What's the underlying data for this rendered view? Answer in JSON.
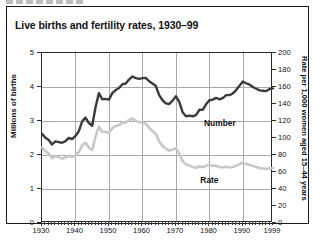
{
  "title": "Live births and fertility rates, 1930–99",
  "axis": {
    "left_title": "Millions of births",
    "right_title": "Rate per 1,000 women aged 15–44 years",
    "left_ticks": [
      "0",
      "1",
      "2",
      "3",
      "4",
      "5"
    ],
    "right_ticks": [
      "0",
      "20",
      "40",
      "60",
      "80",
      "100",
      "120",
      "140",
      "160",
      "180",
      "200"
    ],
    "x_ticks": [
      "1930",
      "1940",
      "1950",
      "1960",
      "1970",
      "1980",
      "1990",
      "1999"
    ]
  },
  "labels": {
    "number": "Number",
    "rate": "Rate"
  },
  "colors": {
    "number_line": "#3a3a3a",
    "rate_line": "#c8c8c8",
    "grid": "#a9a9a9",
    "frame": "#1a1a1a"
  },
  "chart_data": {
    "type": "line",
    "title": "Live births and fertility rates, 1930–99",
    "xlabel": "",
    "ylabel": "Millions of births",
    "y2label": "Rate per 1,000 women aged 15–44 years",
    "xlim": [
      1930,
      1999
    ],
    "ylim": [
      0,
      5
    ],
    "y2lim": [
      0,
      200
    ],
    "grid": true,
    "legend": "in-plot labels",
    "x": [
      1930,
      1931,
      1932,
      1933,
      1934,
      1935,
      1936,
      1937,
      1938,
      1939,
      1940,
      1941,
      1942,
      1943,
      1944,
      1945,
      1946,
      1947,
      1948,
      1949,
      1950,
      1951,
      1952,
      1953,
      1954,
      1955,
      1956,
      1957,
      1958,
      1959,
      1960,
      1961,
      1962,
      1963,
      1964,
      1965,
      1966,
      1967,
      1968,
      1969,
      1970,
      1971,
      1972,
      1973,
      1974,
      1975,
      1976,
      1977,
      1978,
      1979,
      1980,
      1981,
      1982,
      1983,
      1984,
      1985,
      1986,
      1987,
      1988,
      1989,
      1990,
      1991,
      1992,
      1993,
      1994,
      1995,
      1996,
      1997,
      1998,
      1999
    ],
    "series": [
      {
        "name": "Number",
        "unit": "millions of births",
        "axis": "left",
        "color": "#3a3a3a",
        "values": [
          2.62,
          2.51,
          2.44,
          2.31,
          2.4,
          2.38,
          2.36,
          2.41,
          2.5,
          2.47,
          2.56,
          2.7,
          2.99,
          3.1,
          2.94,
          2.86,
          3.41,
          3.82,
          3.64,
          3.65,
          3.63,
          3.82,
          3.91,
          3.97,
          4.08,
          4.1,
          4.22,
          4.31,
          4.26,
          4.24,
          4.26,
          4.27,
          4.17,
          4.1,
          4.03,
          3.76,
          3.61,
          3.52,
          3.5,
          3.6,
          3.73,
          3.56,
          3.26,
          3.14,
          3.16,
          3.14,
          3.17,
          3.33,
          3.33,
          3.49,
          3.61,
          3.63,
          3.68,
          3.64,
          3.67,
          3.76,
          3.76,
          3.81,
          3.91,
          4.04,
          4.16,
          4.11,
          4.07,
          4.0,
          3.95,
          3.9,
          3.89,
          3.88,
          3.94,
          3.96
        ]
      },
      {
        "name": "Rate",
        "unit": "births per 1,000 women aged 15-44",
        "axis": "right",
        "color": "#c8c8c8",
        "values": [
          89.2,
          84.6,
          81.7,
          76.3,
          78.5,
          77.2,
          75.8,
          77.1,
          79.1,
          77.6,
          79.9,
          83.4,
          91.5,
          94.3,
          88.8,
          85.9,
          101.9,
          113.3,
          107.3,
          107.1,
          106.2,
          111.5,
          113.9,
          115.2,
          118.1,
          118.3,
          121.2,
          122.9,
          120.2,
          118.8,
          118.0,
          117.1,
          112.0,
          108.3,
          104.7,
          96.3,
          90.8,
          87.2,
          85.2,
          86.1,
          87.9,
          81.6,
          73.1,
          68.8,
          67.8,
          66.0,
          65.0,
          66.8,
          65.5,
          67.2,
          68.4,
          67.3,
          67.3,
          65.7,
          65.5,
          66.3,
          65.4,
          65.8,
          67.3,
          69.2,
          70.9,
          69.3,
          68.4,
          67.0,
          65.9,
          64.6,
          64.1,
          63.6,
          64.3,
          64.4
        ]
      }
    ]
  }
}
